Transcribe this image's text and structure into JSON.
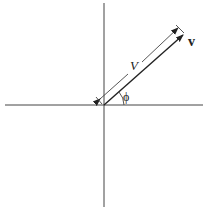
{
  "diagram": {
    "vector_label": "v",
    "magnitude_label": "V",
    "angle_label": "ϕ",
    "colors": {
      "line": "#333333",
      "background": "#ffffff"
    }
  }
}
